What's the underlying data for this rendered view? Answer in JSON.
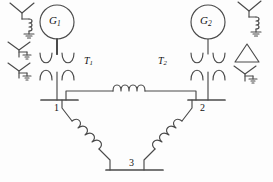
{
  "diagram": {
    "background_color": "#fdfdfd",
    "line_color": "#4a4a4a",
    "text_color": "#111111",
    "generators": [
      {
        "id": "g1",
        "label": "G",
        "subscript": "1",
        "symbol": "generator-circle",
        "cx": 57,
        "cy": 22,
        "r": 17
      },
      {
        "id": "g2",
        "label": "G",
        "subscript": "2",
        "symbol": "generator-circle",
        "cx": 208,
        "cy": 22,
        "r": 17
      }
    ],
    "transformers": [
      {
        "id": "t1",
        "label": "T",
        "subscript": "1",
        "symbol": "two-winding-transformer",
        "label_x": 85,
        "label_y": 57
      },
      {
        "id": "t2",
        "label": "T",
        "subscript": "2",
        "symbol": "two-winding-transformer",
        "label_x": 159,
        "label_y": 57
      }
    ],
    "buses": [
      {
        "id": "bus1",
        "label": "1",
        "label_x": 55,
        "label_y": 110
      },
      {
        "id": "bus2",
        "label": "2",
        "label_x": 203,
        "label_y": 110
      },
      {
        "id": "bus3",
        "label": "3",
        "label_x": 131,
        "label_y": 158
      }
    ],
    "branches": [
      {
        "id": "line-1-2",
        "from": "bus1",
        "to": "bus2",
        "symbol": "series-inductor",
        "coils": 4,
        "orientation": "horizontal"
      },
      {
        "id": "line-1-3",
        "from": "bus1",
        "to": "bus3",
        "symbol": "series-inductor",
        "coils": 4,
        "orientation": "diagonal-down-right"
      },
      {
        "id": "line-2-3",
        "from": "bus2",
        "to": "bus3",
        "symbol": "series-inductor",
        "coils": 4,
        "orientation": "diagonal-down-left"
      }
    ],
    "legend_left": [
      {
        "id": "legend-l1",
        "symbol": "wye-reactor-grounded",
        "description": "wye connection grounded through reactor"
      },
      {
        "id": "legend-l2",
        "symbol": "wye-solidly-grounded",
        "description": "wye connection solidly grounded"
      },
      {
        "id": "legend-l3",
        "symbol": "wye-solidly-grounded",
        "description": "wye connection solidly grounded"
      }
    ],
    "legend_right": [
      {
        "id": "legend-r1",
        "symbol": "wye-reactor-grounded",
        "description": "wye connection grounded through reactor"
      },
      {
        "id": "legend-r2",
        "symbol": "delta",
        "description": "delta connection"
      },
      {
        "id": "legend-r3",
        "symbol": "wye-solidly-grounded",
        "description": "wye connection solidly grounded"
      }
    ]
  }
}
